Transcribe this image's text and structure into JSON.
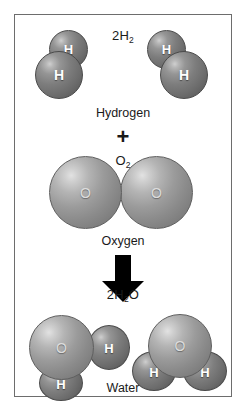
{
  "diagram": {
    "equation": "2H2 + O2 -> 2H2O",
    "border_color": "#6d6d6d",
    "background_color": "#ffffff",
    "atom_label_color": "#ffffff",
    "text_color": "#1a1a1a",
    "oxygen_sphere_color": "#9b9b9b",
    "hydrogen_sphere_color": "#7d7d7d",
    "arrow_color": "#000000"
  },
  "reactants": {
    "hydrogen": {
      "formula_prefix": "2H",
      "formula_subscript": "2",
      "name": "Hydrogen",
      "molecule_count": 2,
      "atoms_per_molecule": 2,
      "atom_label": "H"
    },
    "plus_sign": "+",
    "oxygen": {
      "formula_prefix": "O",
      "formula_subscript": "2",
      "name": "Oxygen",
      "molecule_count": 1,
      "atoms_per_molecule": 2,
      "atom_label": "O"
    }
  },
  "arrow": {
    "direction": "down",
    "meaning": "yields"
  },
  "products": {
    "water": {
      "formula_prefix": "2H",
      "formula_subscript": "2",
      "formula_suffix": "O",
      "name": "Water",
      "molecule_count": 2,
      "oxygen_label": "O",
      "hydrogen_label": "H"
    }
  }
}
